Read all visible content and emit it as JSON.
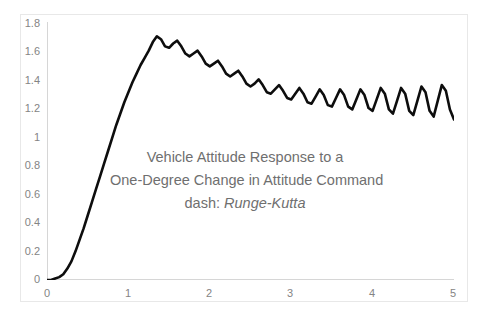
{
  "clipped_top_text": "",
  "annotation": {
    "line1": "Vehicle Attitude Response to a",
    "line2": "One-Degree Change in Attitude Command",
    "line3_prefix": "dash: ",
    "line3_italic": "Runge-Kutta"
  },
  "colors": {
    "curve": "#0d0d0d",
    "axis": "#d6d6d6",
    "tick_text": "#848484",
    "annotation_text": "#6f6f6f",
    "border": "#e8e8e8",
    "background": "#ffffff"
  },
  "chart_data": {
    "type": "line",
    "title": "Vehicle Attitude Response to a One-Degree Change in Attitude Command",
    "subtitle": "dash: Runge-Kutta",
    "xlabel": "",
    "ylabel": "",
    "xlim": [
      0,
      5
    ],
    "ylim": [
      0,
      1.8
    ],
    "grid": false,
    "legend": null,
    "xticks": [
      "0",
      "1",
      "2",
      "3",
      "4",
      "5"
    ],
    "xtick_values": [
      0,
      1,
      2,
      3,
      4,
      5
    ],
    "yticks": [
      "0",
      "0.2",
      "0.4",
      "0.6",
      "0.8",
      "1",
      "1.2",
      "1.4",
      "1.6",
      "1.8"
    ],
    "ytick_values": [
      0,
      0.2,
      0.4,
      0.6,
      0.8,
      1.0,
      1.2,
      1.4,
      1.6,
      1.8
    ],
    "series": [
      {
        "name": "Runge-Kutta attitude response",
        "note": "Step response with superimposed high-frequency ripple whose amplitude grows with time; mean settles from 1.70 peak toward ~1.25",
        "x": [
          0.0,
          0.05,
          0.1,
          0.15,
          0.2,
          0.25,
          0.3,
          0.35,
          0.4,
          0.45,
          0.5,
          0.55,
          0.6,
          0.65,
          0.7,
          0.75,
          0.8,
          0.85,
          0.9,
          0.95,
          1.0,
          1.05,
          1.1,
          1.15,
          1.2,
          1.25,
          1.3,
          1.35,
          1.4,
          1.45,
          1.5,
          1.55,
          1.6,
          1.65,
          1.7,
          1.75,
          1.8,
          1.85,
          1.9,
          1.95,
          2.0,
          2.05,
          2.1,
          2.15,
          2.2,
          2.25,
          2.3,
          2.35,
          2.4,
          2.45,
          2.5,
          2.55,
          2.6,
          2.65,
          2.7,
          2.75,
          2.8,
          2.85,
          2.9,
          2.95,
          3.0,
          3.05,
          3.1,
          3.15,
          3.2,
          3.25,
          3.3,
          3.35,
          3.4,
          3.45,
          3.5,
          3.55,
          3.6,
          3.65,
          3.7,
          3.75,
          3.8,
          3.85,
          3.9,
          3.95,
          4.0,
          4.05,
          4.1,
          4.15,
          4.2,
          4.25,
          4.3,
          4.35,
          4.4,
          4.45,
          4.5,
          4.55,
          4.6,
          4.65,
          4.7,
          4.75,
          4.8,
          4.85,
          4.9,
          4.95,
          5.0
        ],
        "y": [
          0.0,
          0.0,
          0.01,
          0.02,
          0.04,
          0.08,
          0.13,
          0.2,
          0.28,
          0.36,
          0.45,
          0.54,
          0.63,
          0.72,
          0.81,
          0.9,
          0.99,
          1.08,
          1.16,
          1.24,
          1.31,
          1.38,
          1.44,
          1.5,
          1.55,
          1.6,
          1.66,
          1.7,
          1.68,
          1.63,
          1.62,
          1.65,
          1.67,
          1.63,
          1.58,
          1.56,
          1.58,
          1.6,
          1.56,
          1.51,
          1.49,
          1.51,
          1.53,
          1.49,
          1.44,
          1.42,
          1.44,
          1.46,
          1.42,
          1.37,
          1.35,
          1.37,
          1.4,
          1.36,
          1.31,
          1.3,
          1.33,
          1.36,
          1.32,
          1.27,
          1.26,
          1.3,
          1.34,
          1.3,
          1.24,
          1.23,
          1.28,
          1.33,
          1.29,
          1.22,
          1.21,
          1.27,
          1.33,
          1.29,
          1.21,
          1.19,
          1.26,
          1.33,
          1.29,
          1.2,
          1.18,
          1.26,
          1.34,
          1.3,
          1.19,
          1.16,
          1.25,
          1.34,
          1.3,
          1.18,
          1.15,
          1.25,
          1.35,
          1.31,
          1.18,
          1.14,
          1.25,
          1.36,
          1.32,
          1.19,
          1.12
        ]
      }
    ]
  }
}
